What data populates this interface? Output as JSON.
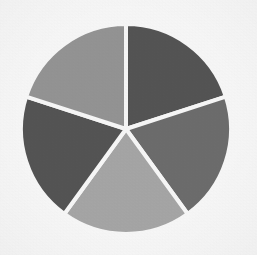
{
  "figure": {
    "background_color": "#fbfbfb",
    "width": 257,
    "height": 255,
    "title": "",
    "subtitle": "",
    "alt_text": "Pie chart with five equal gray slices"
  },
  "geometry": {
    "center_x": 126,
    "center_y": 129,
    "radius": 105,
    "gap_color": "#fbfbfb",
    "gap_width_px": 4,
    "start_angle_deg": 0
  },
  "chart_data": {
    "type": "pie",
    "title": "",
    "xlabel": "",
    "ylabel": "",
    "legend_position": "none",
    "grid": false,
    "labels": [
      "Slice 1",
      "Slice 2",
      "Slice 3",
      "Slice 4",
      "Slice 5"
    ],
    "values": [
      20,
      20,
      20,
      20,
      20
    ],
    "percentages": [
      "20%",
      "20%",
      "20%",
      "20%",
      "20%"
    ],
    "angles_deg": [
      72,
      72,
      72,
      72,
      72
    ],
    "colors": [
      "#555555",
      "#6e6e6e",
      "#a8a8a8",
      "#555555",
      "#969696"
    ],
    "slices": [
      {
        "label": "Slice 1",
        "value": 20,
        "percent": "20%",
        "color": "#555555",
        "start_deg": 0,
        "end_deg": 72
      },
      {
        "label": "Slice 2",
        "value": 20,
        "percent": "20%",
        "color": "#6e6e6e",
        "start_deg": 72,
        "end_deg": 144
      },
      {
        "label": "Slice 3",
        "value": 20,
        "percent": "20%",
        "color": "#a8a8a8",
        "start_deg": 144,
        "end_deg": 216
      },
      {
        "label": "Slice 4",
        "value": 20,
        "percent": "20%",
        "color": "#555555",
        "start_deg": 216,
        "end_deg": 288
      },
      {
        "label": "Slice 5",
        "value": 20,
        "percent": "20%",
        "color": "#969696",
        "start_deg": 288,
        "end_deg": 360
      }
    ]
  }
}
